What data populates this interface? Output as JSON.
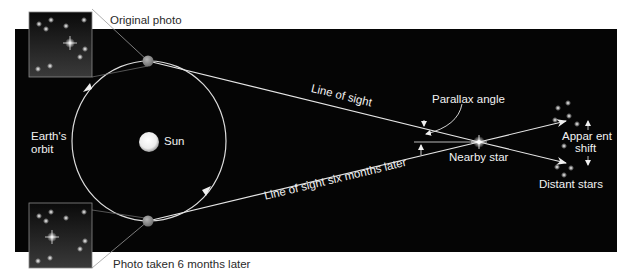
{
  "diagram": {
    "colors": {
      "background": "#ffffff",
      "space": "#050505",
      "line": "#e6e6e6",
      "earth": "#8a8a8a",
      "sun": "#f4f4f4",
      "label_dark": "#2a2a2a",
      "label_light": "#f2f2f2"
    },
    "labels": {
      "original_photo": "Original photo",
      "photo_later": "Photo taken 6 months later",
      "earths_orbit_line1": "Earth's",
      "earths_orbit_line2": "orbit",
      "sun": "Sun",
      "line_of_sight": "Line of sight",
      "line_of_sight_later": "Line of sight six months later",
      "parallax_angle": "Parallax angle",
      "nearby_star": "Nearby star",
      "apparent_shift_line1": "Appar ent",
      "apparent_shift_line2": "shift",
      "distant_stars": "Distant stars"
    },
    "nodes": [
      {
        "id": "sun",
        "label": "Sun",
        "x": 148,
        "y": 141
      },
      {
        "id": "earth-original",
        "label": "Earth (original position)",
        "x": 148,
        "y": 61
      },
      {
        "id": "earth-six-months",
        "label": "Earth (six months later)",
        "x": 148,
        "y": 221
      },
      {
        "id": "nearby-star",
        "label": "Nearby star",
        "x": 479,
        "y": 142
      },
      {
        "id": "distant-stars",
        "label": "Distant stars",
        "x": 570,
        "y": 145
      }
    ],
    "edges": [
      {
        "from": "earth-original",
        "to": "nearby-star",
        "label": "Line of sight"
      },
      {
        "from": "earth-six-months",
        "to": "nearby-star",
        "label": "Line of sight six months later"
      },
      {
        "from": "nearby-star",
        "to": "distant-stars",
        "label": "projected (upper)"
      },
      {
        "from": "nearby-star",
        "to": "distant-stars",
        "label": "projected (lower)"
      }
    ],
    "insets": [
      {
        "id": "original-photo",
        "label": "Original photo"
      },
      {
        "id": "photo-six-months-later",
        "label": "Photo taken 6 months later"
      }
    ]
  }
}
